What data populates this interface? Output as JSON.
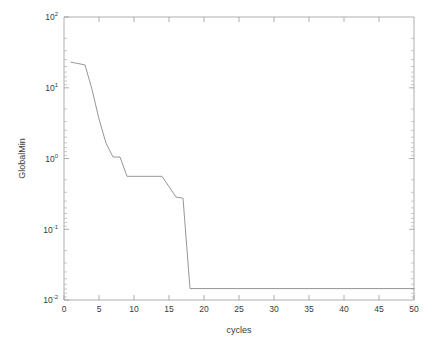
{
  "chart_data": {
    "type": "line",
    "title": "",
    "xlabel": "cycles",
    "ylabel": "GlobalMin",
    "xlim": [
      0,
      50
    ],
    "ylim": [
      0.01,
      100
    ],
    "yscale": "log",
    "xscale": "linear",
    "grid": false,
    "legend": null,
    "xticks": [
      0,
      5,
      10,
      15,
      20,
      25,
      30,
      35,
      40,
      45,
      50
    ],
    "xtick_labels": [
      "0",
      "5",
      "10",
      "15",
      "20",
      "25",
      "30",
      "35",
      "40",
      "45",
      "50"
    ],
    "yticks": [
      0.01,
      0.1,
      1,
      10,
      100
    ],
    "ytick_labels": [
      "10-2",
      "10-1",
      "100",
      "101",
      "102"
    ],
    "ytick_mantissa": [
      "10",
      "10",
      "10",
      "10",
      "10"
    ],
    "ytick_exponent": [
      "-2",
      "-1",
      "0",
      "1",
      "2"
    ],
    "line_color": "#8a8a8a",
    "line_width": 0.9,
    "series": [
      {
        "name": "GlobalMin",
        "x": [
          1,
          2,
          3,
          4,
          5,
          6,
          7,
          8,
          9,
          10,
          11,
          12,
          13,
          14,
          15,
          16,
          17,
          18,
          19,
          20,
          21,
          22,
          23,
          24,
          25,
          26,
          27,
          28,
          29,
          30,
          31,
          32,
          33,
          34,
          35,
          36,
          37,
          38,
          39,
          40,
          41,
          42,
          43,
          44,
          45,
          46,
          47,
          48,
          49,
          50
        ],
        "y": [
          23.0,
          22.0,
          21.0,
          9.5,
          3.6,
          1.65,
          1.05,
          1.05,
          0.56,
          0.56,
          0.56,
          0.56,
          0.56,
          0.56,
          0.4,
          0.285,
          0.275,
          0.0145,
          0.0145,
          0.0145,
          0.0145,
          0.0145,
          0.0145,
          0.0145,
          0.0145,
          0.0145,
          0.0145,
          0.0145,
          0.0145,
          0.0145,
          0.0145,
          0.0145,
          0.0145,
          0.0145,
          0.0145,
          0.0145,
          0.0145,
          0.0145,
          0.0145,
          0.0145,
          0.0145,
          0.0145,
          0.0145,
          0.0145,
          0.0145,
          0.0145,
          0.0145,
          0.0145,
          0.0145,
          0.0145
        ]
      }
    ]
  },
  "axes": {
    "x_axis_name": "cycles",
    "y_axis_name": "GlobalMin"
  }
}
